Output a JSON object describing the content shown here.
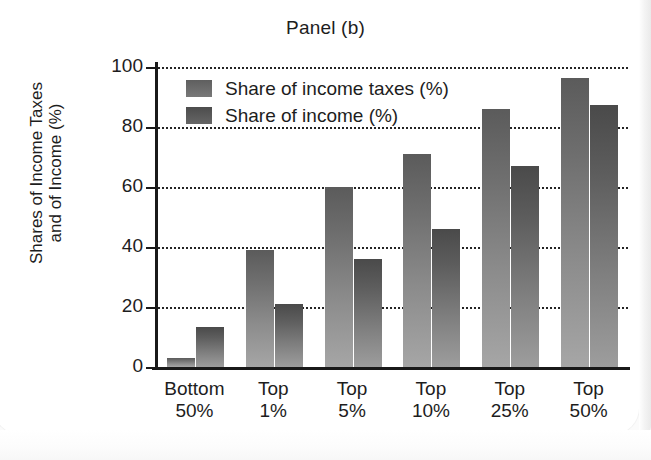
{
  "chart_data": {
    "type": "bar",
    "title": "Panel (b)",
    "xlabel": "",
    "ylabel": "Shares of Income Taxes and of Income (%)",
    "ylabel_lines": [
      "Shares of Income Taxes",
      "and of Income (%)"
    ],
    "categories": [
      "Bottom 50%",
      "Top 1%",
      "Top 5%",
      "Top 10%",
      "Top 25%",
      "Top 50%"
    ],
    "category_lines": [
      [
        "Bottom",
        "50%"
      ],
      [
        "Top",
        "1%"
      ],
      [
        "Top",
        "5%"
      ],
      [
        "Top",
        "10%"
      ],
      [
        "Top",
        "25%"
      ],
      [
        "Top",
        "50%"
      ]
    ],
    "series": [
      {
        "name": "Share of income taxes (%)",
        "color": "#6e6e6e",
        "values": [
          3,
          39,
          60,
          71,
          86,
          96.5
        ]
      },
      {
        "name": "Share of income (%)",
        "color": "#5d5d5d",
        "values": [
          13.5,
          21,
          36,
          46,
          67,
          87.5
        ]
      }
    ],
    "ylim": [
      0,
      100
    ],
    "yticks": [
      0,
      20,
      40,
      60,
      80,
      100
    ],
    "ytick_labels": [
      "0",
      "20",
      "40",
      "60",
      "80",
      "100"
    ],
    "grid": true,
    "grid_style": "dotted-horizontal",
    "legend_position": "upper-left-inside"
  }
}
